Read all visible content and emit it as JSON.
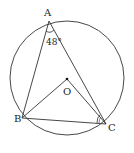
{
  "diagram": {
    "type": "geometry",
    "points": {
      "A": {
        "label": "A",
        "x": 49,
        "y": 21
      },
      "B": {
        "label": "B",
        "x": 22,
        "y": 118
      },
      "C": {
        "label": "C",
        "x": 106,
        "y": 124
      },
      "O": {
        "label": "O",
        "x": 67,
        "y": 79
      }
    },
    "circle": {
      "cx": 67,
      "cy": 78,
      "r": 57
    },
    "angle_A": {
      "label": "48°",
      "value": 48
    },
    "angle_C_mark": "arc"
  },
  "colors": {
    "stroke": "#333333",
    "background": "#ffffff"
  }
}
